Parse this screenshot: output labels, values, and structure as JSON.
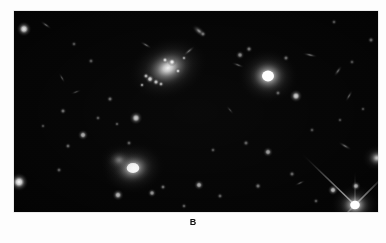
{
  "figure": {
    "panel_label": "B",
    "plate": {
      "background_color": "#030303",
      "page_background_color": "#fdfdfd",
      "frame": {
        "x": 14,
        "y": 11,
        "width": 364,
        "height": 201
      },
      "description": "deep astronomical exposure of a galaxy cluster field"
    }
  },
  "sky_objects": {
    "extended_galaxies": [
      {
        "name": "central-irregular-spiral-galaxy",
        "cx": 168,
        "cy": 68,
        "rx": 27,
        "ry": 20,
        "angle": -22,
        "peak": 0.92,
        "type": "diffuse-spiral"
      },
      {
        "name": "bright-elliptical-galaxy-right",
        "cx": 268,
        "cy": 76,
        "rx": 20,
        "ry": 18,
        "angle": 0,
        "peak": 1.0,
        "type": "elliptical"
      },
      {
        "name": "elliptical-galaxy-lower-left",
        "cx": 133,
        "cy": 168,
        "rx": 21,
        "ry": 17,
        "angle": -10,
        "peak": 0.88,
        "type": "elliptical"
      },
      {
        "name": "faint-halo-galaxy-lower-left",
        "cx": 119,
        "cy": 160,
        "rx": 13,
        "ry": 11,
        "angle": 0,
        "peak": 0.34,
        "type": "diffuse-halo"
      },
      {
        "name": "saturated-star-bottom-right",
        "cx": 355,
        "cy": 205,
        "rx": 16,
        "ry": 14,
        "angle": 0,
        "peak": 1.0,
        "type": "saturated-star"
      },
      {
        "name": "bright-blob-right-edge",
        "cx": 377,
        "cy": 158,
        "rx": 10,
        "ry": 9,
        "angle": 0,
        "peak": 0.72,
        "type": "compact"
      }
    ],
    "knots": [
      {
        "name": "hii-knot",
        "cx": 150,
        "cy": 79,
        "r": 2.4,
        "peak": 0.88
      },
      {
        "name": "hii-knot",
        "cx": 156,
        "cy": 82,
        "r": 2.0,
        "peak": 0.8
      },
      {
        "name": "hii-knot",
        "cx": 146,
        "cy": 76,
        "r": 1.8,
        "peak": 0.74
      },
      {
        "name": "hii-knot",
        "cx": 161,
        "cy": 84,
        "r": 1.7,
        "peak": 0.7
      },
      {
        "name": "hii-knot",
        "cx": 172,
        "cy": 62,
        "r": 2.2,
        "peak": 0.95
      },
      {
        "name": "hii-knot",
        "cx": 165,
        "cy": 60,
        "r": 1.8,
        "peak": 0.82
      },
      {
        "name": "hii-knot",
        "cx": 178,
        "cy": 71,
        "r": 1.6,
        "peak": 0.78
      },
      {
        "name": "hii-knot",
        "cx": 142,
        "cy": 85,
        "r": 1.5,
        "peak": 0.62
      },
      {
        "name": "hii-knot",
        "cx": 184,
        "cy": 58,
        "r": 1.5,
        "peak": 0.6
      }
    ],
    "point_sources": [
      {
        "name": "star",
        "cx": 24,
        "cy": 29,
        "r": 3.4,
        "peak": 0.92
      },
      {
        "name": "star",
        "cx": 19,
        "cy": 182,
        "r": 4.2,
        "peak": 0.98
      },
      {
        "name": "star",
        "cx": 63,
        "cy": 111,
        "r": 1.6,
        "peak": 0.45
      },
      {
        "name": "star",
        "cx": 83,
        "cy": 135,
        "r": 2.4,
        "peak": 0.72
      },
      {
        "name": "star",
        "cx": 68,
        "cy": 146,
        "r": 1.5,
        "peak": 0.42
      },
      {
        "name": "star",
        "cx": 98,
        "cy": 118,
        "r": 1.4,
        "peak": 0.36
      },
      {
        "name": "star",
        "cx": 110,
        "cy": 99,
        "r": 1.6,
        "peak": 0.44
      },
      {
        "name": "star",
        "cx": 117,
        "cy": 124,
        "r": 1.3,
        "peak": 0.34
      },
      {
        "name": "star",
        "cx": 136,
        "cy": 118,
        "r": 3.0,
        "peak": 0.82
      },
      {
        "name": "star",
        "cx": 129,
        "cy": 143,
        "r": 1.5,
        "peak": 0.38
      },
      {
        "name": "star",
        "cx": 118,
        "cy": 195,
        "r": 2.6,
        "peak": 0.74
      },
      {
        "name": "star",
        "cx": 59,
        "cy": 170,
        "r": 1.5,
        "peak": 0.38
      },
      {
        "name": "star",
        "cx": 43,
        "cy": 126,
        "r": 1.3,
        "peak": 0.3
      },
      {
        "name": "star",
        "cx": 91,
        "cy": 61,
        "r": 1.5,
        "peak": 0.36
      },
      {
        "name": "star",
        "cx": 74,
        "cy": 44,
        "r": 1.4,
        "peak": 0.34
      },
      {
        "name": "star",
        "cx": 152,
        "cy": 193,
        "r": 2.0,
        "peak": 0.62
      },
      {
        "name": "star",
        "cx": 163,
        "cy": 187,
        "r": 1.5,
        "peak": 0.45
      },
      {
        "name": "star",
        "cx": 199,
        "cy": 185,
        "r": 2.3,
        "peak": 0.7
      },
      {
        "name": "star",
        "cx": 220,
        "cy": 196,
        "r": 1.5,
        "peak": 0.4
      },
      {
        "name": "star",
        "cx": 184,
        "cy": 206,
        "r": 1.4,
        "peak": 0.38
      },
      {
        "name": "star",
        "cx": 213,
        "cy": 150,
        "r": 1.4,
        "peak": 0.34
      },
      {
        "name": "star",
        "cx": 246,
        "cy": 143,
        "r": 1.6,
        "peak": 0.4
      },
      {
        "name": "star",
        "cx": 268,
        "cy": 152,
        "r": 2.3,
        "peak": 0.66
      },
      {
        "name": "star",
        "cx": 258,
        "cy": 186,
        "r": 1.7,
        "peak": 0.46
      },
      {
        "name": "star",
        "cx": 292,
        "cy": 174,
        "r": 1.6,
        "peak": 0.42
      },
      {
        "name": "star",
        "cx": 312,
        "cy": 130,
        "r": 1.4,
        "peak": 0.32
      },
      {
        "name": "star",
        "cx": 340,
        "cy": 120,
        "r": 1.3,
        "peak": 0.3
      },
      {
        "name": "star",
        "cx": 296,
        "cy": 96,
        "r": 2.9,
        "peak": 0.84
      },
      {
        "name": "star",
        "cx": 240,
        "cy": 55,
        "r": 2.0,
        "peak": 0.56
      },
      {
        "name": "star",
        "cx": 249,
        "cy": 49,
        "r": 1.7,
        "peak": 0.48
      },
      {
        "name": "star",
        "cx": 286,
        "cy": 58,
        "r": 1.6,
        "peak": 0.44
      },
      {
        "name": "star",
        "cx": 278,
        "cy": 93,
        "r": 1.5,
        "peak": 0.4
      },
      {
        "name": "star",
        "cx": 203,
        "cy": 34,
        "r": 1.6,
        "peak": 0.42
      },
      {
        "name": "star",
        "cx": 334,
        "cy": 22,
        "r": 1.4,
        "peak": 0.34
      },
      {
        "name": "star",
        "cx": 371,
        "cy": 40,
        "r": 1.6,
        "peak": 0.4
      },
      {
        "name": "star",
        "cx": 352,
        "cy": 62,
        "r": 1.4,
        "peak": 0.32
      },
      {
        "name": "star",
        "cx": 363,
        "cy": 109,
        "r": 1.3,
        "peak": 0.3
      },
      {
        "name": "star",
        "cx": 333,
        "cy": 190,
        "r": 2.4,
        "peak": 0.78
      },
      {
        "name": "star",
        "cx": 356,
        "cy": 186,
        "r": 2.2,
        "peak": 0.72
      },
      {
        "name": "star",
        "cx": 316,
        "cy": 201,
        "r": 1.4,
        "peak": 0.36
      }
    ],
    "edge_on_galaxies": [
      {
        "name": "edge-on-galaxy",
        "cx": 46,
        "cy": 25,
        "rx": 7,
        "ry": 2.2,
        "angle": 35,
        "peak": 0.38
      },
      {
        "name": "edge-on-galaxy",
        "cx": 62,
        "cy": 78,
        "rx": 6,
        "ry": 2.0,
        "angle": 60,
        "peak": 0.32
      },
      {
        "name": "edge-on-galaxy",
        "cx": 199,
        "cy": 31,
        "rx": 9,
        "ry": 4.5,
        "angle": 40,
        "peak": 0.58
      },
      {
        "name": "edge-on-galaxy",
        "cx": 146,
        "cy": 45,
        "rx": 7,
        "ry": 2.2,
        "angle": 30,
        "peak": 0.4
      },
      {
        "name": "edge-on-galaxy",
        "cx": 189,
        "cy": 51,
        "rx": 8,
        "ry": 2.4,
        "angle": -40,
        "peak": 0.42
      },
      {
        "name": "edge-on-galaxy",
        "cx": 238,
        "cy": 65,
        "rx": 7,
        "ry": 2.2,
        "angle": 20,
        "peak": 0.36
      },
      {
        "name": "edge-on-galaxy",
        "cx": 310,
        "cy": 55,
        "rx": 8,
        "ry": 2.3,
        "angle": 12,
        "peak": 0.44
      },
      {
        "name": "edge-on-galaxy",
        "cx": 338,
        "cy": 71,
        "rx": 7,
        "ry": 2.6,
        "angle": -55,
        "peak": 0.4
      },
      {
        "name": "edge-on-galaxy",
        "cx": 349,
        "cy": 96,
        "rx": 7,
        "ry": 2.2,
        "angle": -60,
        "peak": 0.38
      },
      {
        "name": "edge-on-galaxy",
        "cx": 345,
        "cy": 146,
        "rx": 8,
        "ry": 2.4,
        "angle": 30,
        "peak": 0.42
      },
      {
        "name": "edge-on-galaxy",
        "cx": 300,
        "cy": 183,
        "rx": 6,
        "ry": 2.0,
        "angle": -25,
        "peak": 0.34
      },
      {
        "name": "edge-on-galaxy",
        "cx": 76,
        "cy": 92,
        "rx": 6,
        "ry": 2.0,
        "angle": -20,
        "peak": 0.28
      },
      {
        "name": "edge-on-galaxy",
        "cx": 230,
        "cy": 110,
        "rx": 6,
        "ry": 2.0,
        "angle": 50,
        "peak": 0.26
      }
    ],
    "diffraction_spikes": [
      {
        "name": "spike-up-left",
        "x1": 355,
        "y1": 205,
        "x2": 300,
        "y2": 152,
        "width": 1.6,
        "peak": 0.85
      },
      {
        "name": "spike-up-right",
        "x1": 355,
        "y1": 205,
        "x2": 386,
        "y2": 174,
        "width": 1.6,
        "peak": 0.85
      },
      {
        "name": "spike-down-left",
        "x1": 355,
        "y1": 205,
        "x2": 334,
        "y2": 226,
        "width": 1.4,
        "peak": 0.6
      },
      {
        "name": "spike-vertical",
        "x1": 355,
        "y1": 205,
        "x2": 355,
        "y2": 170,
        "width": 1.2,
        "peak": 0.5
      }
    ]
  }
}
